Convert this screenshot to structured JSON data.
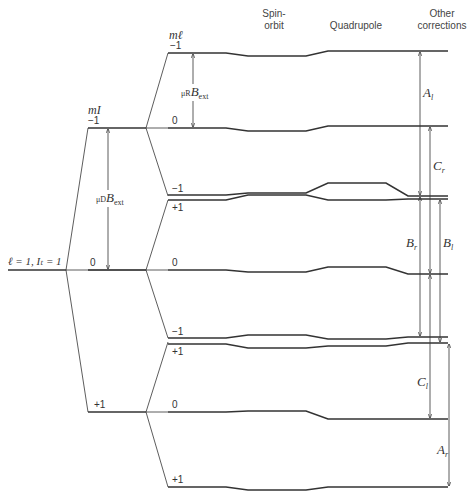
{
  "headers": {
    "spin_orbit": "Spin-\norbit",
    "spin_orbit_l1": "Spin-",
    "spin_orbit_l2": "orbit",
    "quadrupole": "Quadrupole",
    "other_l1": "Other",
    "other_l2": "corrections"
  },
  "initial_state": {
    "label": "ℓ = 1,  I_t = 1",
    "text": "ℓ = 1,  Iₜ = 1"
  },
  "mI_column": {
    "header": "m_I",
    "header_text": "mI",
    "levels": [
      "−1",
      "0",
      "+1"
    ]
  },
  "ml_column": {
    "header": "m_ℓ",
    "header_text": "mℓ",
    "levels": [
      "−1",
      "0",
      "−1",
      "+1",
      "0",
      "−1",
      "+1",
      "0",
      "+1"
    ]
  },
  "energy_labels": {
    "muR": "μR",
    "muD": "μD",
    "B": "B",
    "ext": "ext"
  },
  "transitions": {
    "A_l": "A",
    "A_l_sub": "l",
    "A_r": "A",
    "A_r_sub": "r",
    "B_r": "B",
    "B_r_sub": "r",
    "B_l": "B",
    "B_l_sub": "l",
    "C_r": "C",
    "C_r_sub": "r",
    "C_l": "C",
    "C_l_sub": "l"
  }
}
